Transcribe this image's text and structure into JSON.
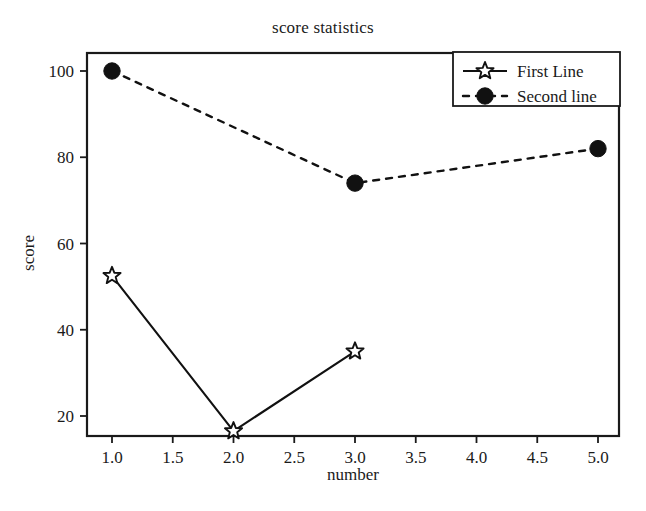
{
  "chart_data": {
    "type": "line",
    "title": "score statistics",
    "xlabel": "number",
    "ylabel": "score",
    "xlim": [
      0.85,
      5.2
    ],
    "ylim": [
      13,
      104
    ],
    "grid": false,
    "legend_position": "top-right",
    "xticks": [
      "1.0",
      "1.5",
      "2.0",
      "2.5",
      "3.0",
      "3.5",
      "4.0",
      "4.5",
      "5.0"
    ],
    "xtick_values": [
      1.0,
      1.5,
      2.0,
      2.5,
      3.0,
      3.5,
      4.0,
      4.5,
      5.0
    ],
    "yticks": [
      "20",
      "40",
      "60",
      "80",
      "100"
    ],
    "ytick_values": [
      20,
      40,
      60,
      80,
      100
    ],
    "series": [
      {
        "name": "First Line",
        "marker": "star",
        "linestyle": "solid",
        "color": "#111111",
        "x": [
          1.0,
          2.0,
          3.0
        ],
        "values": [
          52.5,
          16.5,
          35.0
        ]
      },
      {
        "name": "Second line",
        "marker": "circle",
        "linestyle": "dashed",
        "color": "#111111",
        "x": [
          1.0,
          3.0,
          5.0
        ],
        "values": [
          100.0,
          74.0,
          82.0
        ]
      }
    ]
  },
  "legend": {
    "entries": [
      {
        "label": "First Line"
      },
      {
        "label": "Second line"
      }
    ]
  },
  "axes": {
    "x_title": "number",
    "y_title": "score"
  }
}
